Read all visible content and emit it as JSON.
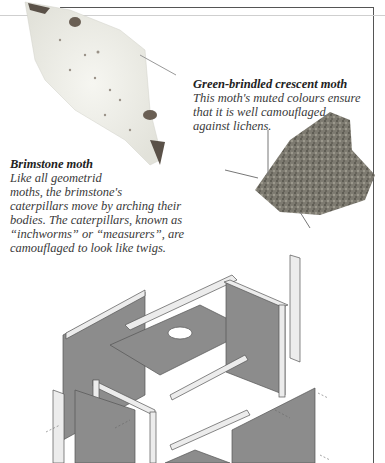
{
  "captions": {
    "green_brindled": {
      "title": "Green-brindled crescent moth",
      "lines": [
        "This moth's muted colours ensure",
        "that it is well camouflaged",
        "against lichens."
      ]
    },
    "brimstone": {
      "title": "Brimstone moth",
      "lines": [
        "Like all geometrid",
        "moths, the brimstone's",
        "caterpillars move by arching their",
        "bodies. The caterpillars, known as",
        "“inchworms” or “measurers”, are",
        "camouflaged to look like twigs."
      ]
    }
  },
  "illustrations": {
    "brimstone_moth": "pale-winged geometrid moth photo",
    "green_brindled_moth": "mottled grey-green moth photo",
    "box_diagram": "exploded view of wooden moth trap box"
  },
  "colors": {
    "panel": "#8c8c8c",
    "batten": "#ececec",
    "frame": "#555555"
  }
}
